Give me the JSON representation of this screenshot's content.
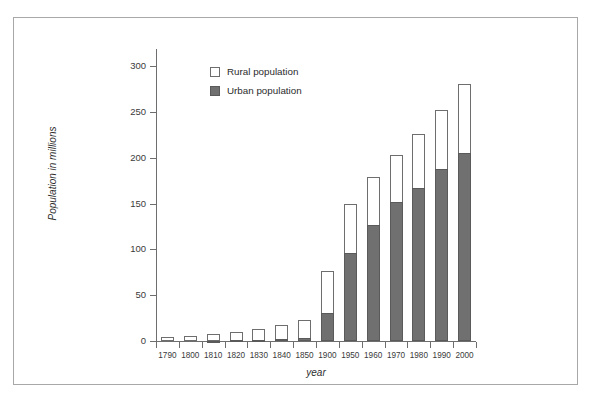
{
  "chart_data": {
    "type": "bar",
    "subtype": "stacked-vertical",
    "title": "",
    "xlabel": "year",
    "ylabel": "Population in millions",
    "categories": [
      "1790",
      "1800",
      "1810",
      "1820",
      "1830",
      "1840",
      "1850",
      "1900",
      "1950",
      "1960",
      "1970",
      "1980",
      "1990",
      "2000"
    ],
    "series": [
      {
        "name": "Urban population",
        "color": "#707070",
        "values": [
          0.2,
          0.3,
          0.5,
          0.7,
          1.1,
          1.8,
          3.5,
          30,
          96,
          127,
          152,
          167,
          188,
          205
        ]
      },
      {
        "name": "Rural population",
        "color": "#ffffff",
        "values": [
          3.8,
          5.0,
          6.7,
          8.9,
          11.8,
          15.2,
          19.5,
          46,
          54,
          52,
          51,
          59,
          64,
          75
        ]
      }
    ],
    "totals": [
      4,
      5.3,
      7.2,
      9.6,
      12.9,
      17,
      23,
      76,
      150,
      179,
      203,
      226,
      252,
      280
    ],
    "ylim": [
      0,
      300
    ],
    "yticks": [
      0,
      50,
      100,
      150,
      200,
      250,
      300
    ],
    "ytick_labels": [
      "0",
      "50",
      "100",
      "150",
      "200",
      "250",
      "300"
    ],
    "grid": false,
    "legend_position": "top-left-inside",
    "legend_entries": [
      "Rural population",
      "Urban population"
    ]
  },
  "legend": {
    "rural_label": "Rural population",
    "urban_label": "Urban population"
  },
  "axes": {
    "x_title": "year",
    "y_title": "Population in millions"
  },
  "colors": {
    "urban_fill": "#707070",
    "rural_fill": "#ffffff",
    "axis": "#6e6e6e",
    "frame": "#a8a8a8",
    "text": "#2b2b2b"
  }
}
